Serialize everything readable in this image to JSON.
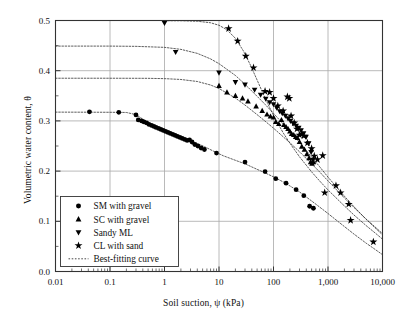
{
  "chart_data": {
    "type": "scatter",
    "title": "",
    "xlabel": "Soil suction, ψ (kPa)",
    "ylabel": "Volumetric water content, θ",
    "xscale": "log",
    "xlim": [
      0.01,
      10000
    ],
    "ylim": [
      0.0,
      0.5
    ],
    "xticks": [
      0.01,
      0.1,
      1,
      10,
      100,
      1000,
      10000
    ],
    "xtick_labels": [
      "0.01",
      "0.1",
      "1",
      "10",
      "100",
      "1,000",
      "10,000"
    ],
    "yticks": [
      0.0,
      0.1,
      0.2,
      0.3,
      0.4,
      0.5
    ],
    "ytick_labels": [
      "0.0",
      "0.1",
      "0.2",
      "0.3",
      "0.4",
      "0.5"
    ],
    "grid": "major-x-and-y",
    "legend_position": "lower-left",
    "series": [
      {
        "name": "SM with gravel",
        "marker": "circle",
        "color": "#000000",
        "points": [
          [
            0.042,
            0.318
          ],
          [
            0.145,
            0.317
          ],
          [
            0.3,
            0.312
          ],
          [
            0.33,
            0.302
          ],
          [
            0.38,
            0.3
          ],
          [
            0.42,
            0.298
          ],
          [
            0.47,
            0.296
          ],
          [
            0.52,
            0.293
          ],
          [
            0.58,
            0.291
          ],
          [
            0.64,
            0.289
          ],
          [
            0.7,
            0.287
          ],
          [
            0.78,
            0.285
          ],
          [
            0.86,
            0.283
          ],
          [
            0.95,
            0.281
          ],
          [
            1.05,
            0.279
          ],
          [
            1.16,
            0.277
          ],
          [
            1.28,
            0.275
          ],
          [
            1.42,
            0.273
          ],
          [
            1.57,
            0.271
          ],
          [
            1.73,
            0.269
          ],
          [
            1.92,
            0.267
          ],
          [
            2.12,
            0.265
          ],
          [
            2.35,
            0.263
          ],
          [
            2.6,
            0.261
          ],
          [
            2.88,
            0.262
          ],
          [
            3.2,
            0.258
          ],
          [
            3.6,
            0.253
          ],
          [
            4.1,
            0.25
          ],
          [
            4.7,
            0.246
          ],
          [
            5.4,
            0.243
          ],
          [
            9.0,
            0.236
          ],
          [
            30.0,
            0.218
          ],
          [
            70.0,
            0.199
          ],
          [
            110.0,
            0.185
          ],
          [
            170.0,
            0.176
          ],
          [
            260.0,
            0.163
          ],
          [
            360.0,
            0.151
          ],
          [
            460.0,
            0.13
          ],
          [
            540.0,
            0.126
          ]
        ]
      },
      {
        "name": "SC with gravel",
        "marker": "triangle-up",
        "color": "#000000",
        "points": [
          [
            10.0,
            0.37
          ],
          [
            14.0,
            0.357
          ],
          [
            20.0,
            0.35
          ],
          [
            27.0,
            0.345
          ],
          [
            34.0,
            0.339
          ],
          [
            48.0,
            0.329
          ],
          [
            62.0,
            0.32
          ],
          [
            76.0,
            0.313
          ],
          [
            88.0,
            0.309
          ],
          [
            100.0,
            0.307
          ],
          [
            110.0,
            0.298
          ],
          [
            125.0,
            0.294
          ],
          [
            140.0,
            0.302
          ],
          [
            155.0,
            0.292
          ],
          [
            170.0,
            0.288
          ],
          [
            185.0,
            0.284
          ],
          [
            200.0,
            0.279
          ],
          [
            215.0,
            0.274
          ],
          [
            235.0,
            0.272
          ],
          [
            255.0,
            0.268
          ],
          [
            275.0,
            0.266
          ],
          [
            300.0,
            0.258
          ],
          [
            330.0,
            0.249
          ],
          [
            370.0,
            0.243
          ],
          [
            410.0,
            0.234
          ],
          [
            450.0,
            0.226
          ],
          [
            480.0,
            0.218
          ],
          [
            510.0,
            0.215
          ],
          [
            540.0,
            0.218
          ]
        ]
      },
      {
        "name": "Sandy ML",
        "marker": "triangle-down",
        "color": "#000000",
        "points": [
          [
            1.0,
            0.495
          ],
          [
            1.6,
            0.437
          ],
          [
            10.0,
            0.396
          ],
          [
            20.0,
            0.377
          ],
          [
            30.0,
            0.372
          ],
          [
            45.0,
            0.362
          ],
          [
            58.0,
            0.352
          ],
          [
            72.0,
            0.344
          ],
          [
            85.0,
            0.337
          ],
          [
            100.0,
            0.333
          ],
          [
            115.0,
            0.326
          ],
          [
            130.0,
            0.319
          ],
          [
            145.0,
            0.315
          ],
          [
            165.0,
            0.31
          ],
          [
            185.0,
            0.305
          ],
          [
            205.0,
            0.3
          ],
          [
            230.0,
            0.295
          ],
          [
            260.0,
            0.29
          ],
          [
            290.0,
            0.286
          ],
          [
            320.0,
            0.281
          ],
          [
            355.0,
            0.275
          ],
          [
            395.0,
            0.268
          ],
          [
            440.0,
            0.255
          ],
          [
            490.0,
            0.238
          ],
          [
            530.0,
            0.222
          ]
        ]
      },
      {
        "name": "CL with sand",
        "marker": "star",
        "color": "#000000",
        "points": [
          [
            15.0,
            0.484
          ],
          [
            22.0,
            0.459
          ],
          [
            31.0,
            0.429
          ],
          [
            43.0,
            0.406
          ],
          [
            70.0,
            0.359
          ],
          [
            85.0,
            0.357
          ],
          [
            100.0,
            0.345
          ],
          [
            120.0,
            0.33
          ],
          [
            150.0,
            0.32
          ],
          [
            180.0,
            0.348
          ],
          [
            195.0,
            0.345
          ],
          [
            210.0,
            0.31
          ],
          [
            240.0,
            0.296
          ],
          [
            270.0,
            0.284
          ],
          [
            300.0,
            0.272
          ],
          [
            330.0,
            0.274
          ],
          [
            360.0,
            0.27
          ],
          [
            420.0,
            0.256
          ],
          [
            500.0,
            0.245
          ],
          [
            560.0,
            0.23
          ],
          [
            640.0,
            0.223
          ],
          [
            800.0,
            0.231
          ],
          [
            870.0,
            0.157
          ],
          [
            1400.0,
            0.171
          ],
          [
            1700.0,
            0.157
          ],
          [
            2400.0,
            0.134
          ],
          [
            2600.0,
            0.102
          ],
          [
            6800.0,
            0.059
          ]
        ]
      }
    ],
    "fitted_curves": [
      {
        "name": "Best-fitting curve",
        "for_series": "Sandy ML",
        "theta_s": 0.449,
        "theta_r": 0.02,
        "points": [
          [
            0.01,
            0.449
          ],
          [
            0.1,
            0.449
          ],
          [
            0.3,
            0.4485
          ],
          [
            1.0,
            0.4465
          ],
          [
            2.0,
            0.4425
          ],
          [
            4.0,
            0.4345
          ],
          [
            7.0,
            0.4235
          ],
          [
            10.0,
            0.414
          ],
          [
            20.0,
            0.3905
          ],
          [
            30.0,
            0.373
          ],
          [
            50.0,
            0.349
          ],
          [
            70.0,
            0.333
          ],
          [
            100.0,
            0.315
          ],
          [
            150.0,
            0.294
          ],
          [
            200.0,
            0.279
          ],
          [
            300.0,
            0.257
          ],
          [
            500.0,
            0.228
          ],
          [
            700.0,
            0.209
          ],
          [
            1000.0,
            0.188
          ],
          [
            2000.0,
            0.15
          ],
          [
            3000.0,
            0.129
          ],
          [
            5000.0,
            0.104
          ],
          [
            7000.0,
            0.089
          ],
          [
            10000.0,
            0.073
          ]
        ]
      },
      {
        "name": "Best-fitting curve",
        "for_series": "SC with gravel",
        "theta_s": 0.385,
        "theta_r": 0.02,
        "points": [
          [
            0.01,
            0.385
          ],
          [
            0.1,
            0.385
          ],
          [
            0.5,
            0.3848
          ],
          [
            1.0,
            0.3842
          ],
          [
            2.0,
            0.3825
          ],
          [
            4.0,
            0.3785
          ],
          [
            7.0,
            0.3715
          ],
          [
            10.0,
            0.3645
          ],
          [
            20.0,
            0.3455
          ],
          [
            30.0,
            0.3315
          ],
          [
            50.0,
            0.3125
          ],
          [
            70.0,
            0.2995
          ],
          [
            100.0,
            0.2855
          ],
          [
            150.0,
            0.2685
          ],
          [
            200.0,
            0.2565
          ],
          [
            300.0,
            0.2385
          ],
          [
            500.0,
            0.2145
          ],
          [
            700.0,
            0.1985
          ],
          [
            1000.0,
            0.1805
          ],
          [
            2000.0,
            0.1465
          ],
          [
            3000.0,
            0.1275
          ],
          [
            5000.0,
            0.1045
          ],
          [
            7000.0,
            0.0905
          ],
          [
            10000.0,
            0.0755
          ]
        ]
      },
      {
        "name": "Best-fitting curve",
        "for_series": "SM with gravel",
        "theta_s": 0.317,
        "theta_r": 0.01,
        "points": [
          [
            0.01,
            0.3175
          ],
          [
            0.1,
            0.3172
          ],
          [
            0.2,
            0.3168
          ],
          [
            0.3,
            0.3125
          ],
          [
            0.5,
            0.2965
          ],
          [
            0.8,
            0.2855
          ],
          [
            1.2,
            0.2775
          ],
          [
            2.0,
            0.2675
          ],
          [
            3.0,
            0.2605
          ],
          [
            5.0,
            0.2505
          ],
          [
            8.0,
            0.2395
          ],
          [
            12.0,
            0.2305
          ],
          [
            20.0,
            0.2215
          ],
          [
            30.0,
            0.2145
          ],
          [
            50.0,
            0.2035
          ],
          [
            70.0,
            0.1965
          ],
          [
            100.0,
            0.1885
          ],
          [
            150.0,
            0.1785
          ],
          [
            200.0,
            0.1705
          ],
          [
            300.0,
            0.1585
          ],
          [
            500.0,
            0.1405
          ],
          [
            700.0,
            0.1285
          ],
          [
            1000.0,
            0.1155
          ],
          [
            2000.0,
            0.0895
          ],
          [
            3000.0,
            0.0745
          ],
          [
            5000.0,
            0.0565
          ],
          [
            7000.0,
            0.0455
          ],
          [
            10000.0,
            0.0335
          ]
        ]
      },
      {
        "name": "Best-fitting curve",
        "for_series": "CL with sand",
        "theta_s": 0.5,
        "theta_r": 0.02,
        "points": [
          [
            1.0,
            0.4995
          ],
          [
            2.0,
            0.4995
          ],
          [
            4.0,
            0.4985
          ],
          [
            7.0,
            0.4955
          ],
          [
            10.0,
            0.4905
          ],
          [
            14.0,
            0.4815
          ],
          [
            20.0,
            0.4645
          ],
          [
            28.0,
            0.4395
          ],
          [
            38.0,
            0.4105
          ],
          [
            50.0,
            0.3815
          ],
          [
            65.0,
            0.3535
          ],
          [
            85.0,
            0.3265
          ],
          [
            110.0,
            0.3025
          ],
          [
            150.0,
            0.2765
          ],
          [
            200.0,
            0.2555
          ],
          [
            300.0,
            0.2285
          ],
          [
            500.0,
            0.1985
          ],
          [
            700.0,
            0.1805
          ],
          [
            1000.0,
            0.1625
          ],
          [
            2000.0,
            0.1305
          ],
          [
            3000.0,
            0.1125
          ],
          [
            5000.0,
            0.0915
          ],
          [
            7000.0,
            0.0785
          ],
          [
            10000.0,
            0.0645
          ]
        ]
      }
    ]
  },
  "legend": {
    "entries": [
      {
        "label": "SM with gravel",
        "marker": "circle"
      },
      {
        "label": "SC with gravel",
        "marker": "triangle-up"
      },
      {
        "label": "Sandy ML",
        "marker": "triangle-down"
      },
      {
        "label": "CL with sand",
        "marker": "star"
      },
      {
        "label": "Best-fitting curve",
        "marker": "dotted-line"
      }
    ]
  }
}
